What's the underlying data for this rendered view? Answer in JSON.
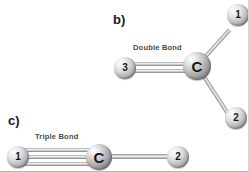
{
  "figure": {
    "background_color": "#ffffff",
    "bond_color": "#b0b0b0",
    "atom_color": "#d9d9d9",
    "label_color": "#1b1b1b",
    "caption_color": "#4a4a4a"
  },
  "panels": [
    {
      "id": "panel-b",
      "label": "b)",
      "caption": "Double Bond",
      "bond_type": "double",
      "atoms": [
        {
          "name": "atom-3",
          "label": "3",
          "kind": "number",
          "x": 125,
          "y": 68,
          "r": 11
        },
        {
          "name": "atom-c",
          "label": "C",
          "kind": "carbon",
          "x": 197,
          "y": 66,
          "r": 14
        },
        {
          "name": "atom-1",
          "label": "1",
          "kind": "number",
          "x": 238,
          "y": 15,
          "r": 11
        },
        {
          "name": "atom-2",
          "label": "2",
          "kind": "number",
          "x": 236,
          "y": 118,
          "r": 11
        }
      ],
      "bonds": [
        {
          "name": "bond-3-c",
          "from": "3",
          "to": "C",
          "order": 2
        },
        {
          "name": "bond-c-1",
          "from": "C",
          "to": "1",
          "order": 1
        },
        {
          "name": "bond-c-2",
          "from": "C",
          "to": "2",
          "order": 1
        }
      ]
    },
    {
      "id": "panel-c",
      "label": "c)",
      "caption": "Triple Bond",
      "bond_type": "triple",
      "atoms": [
        {
          "name": "atom-1",
          "label": "1",
          "kind": "number",
          "x": 18,
          "y": 157,
          "r": 11
        },
        {
          "name": "atom-c",
          "label": "C",
          "kind": "carbon",
          "x": 99,
          "y": 157,
          "r": 13
        },
        {
          "name": "atom-2",
          "label": "2",
          "kind": "number",
          "x": 178,
          "y": 157,
          "r": 11
        }
      ],
      "bonds": [
        {
          "name": "bond-1-c",
          "from": "1",
          "to": "C",
          "order": 3
        },
        {
          "name": "bond-c-2",
          "from": "C",
          "to": "2",
          "order": 1
        }
      ]
    }
  ],
  "panel_b": {
    "label": "b)",
    "caption": "Double Bond",
    "atom_3": "3",
    "atom_c": "C",
    "atom_1": "1",
    "atom_2": "2"
  },
  "panel_c": {
    "label": "c)",
    "caption": "Triple Bond",
    "atom_1": "1",
    "atom_c": "C",
    "atom_2": "2"
  }
}
